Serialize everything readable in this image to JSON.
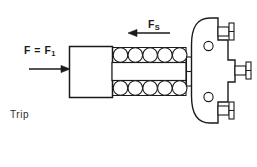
{
  "diagram": {
    "labels": {
      "input_force": "F = F",
      "input_force_subscript": "1",
      "spring_force": "F",
      "spring_force_subscript": "S",
      "trip": "Trip"
    },
    "colors": {
      "stroke": "#1a1a1a",
      "fill": "#ffffff",
      "background": "#ffffff",
      "text": "#1a1a1a"
    },
    "elements": {
      "input_arrow_direction": "right",
      "spring_arrow_direction": "left",
      "block_label": "actuator block",
      "roller_count_top": 5,
      "roller_count_bottom": 5,
      "body_label": "trip body",
      "body_hole_count": 2,
      "stub_count": 3
    }
  }
}
